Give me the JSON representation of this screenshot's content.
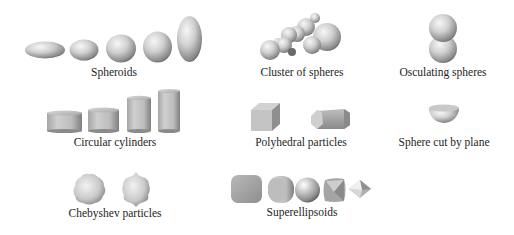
{
  "figure": {
    "background": "#ffffff",
    "shape_color_light": "#f4f4f4",
    "shape_color_mid": "#bdbdbd",
    "shape_color_dark": "#6e6e6e",
    "panels": [
      {
        "id": "spheroids",
        "label": "Spheroids",
        "count": 5
      },
      {
        "id": "cluster",
        "label": "Cluster of spheres",
        "count": 1
      },
      {
        "id": "osculating",
        "label": "Osculating spheres",
        "count": 1
      },
      {
        "id": "cylinders",
        "label": "Circular cylinders",
        "count": 4
      },
      {
        "id": "polyhedral",
        "label": "Polyhedral particles",
        "count": 2
      },
      {
        "id": "sphere-cut",
        "label": "Sphere cut by plane",
        "count": 1
      },
      {
        "id": "chebyshev",
        "label": "Chebyshev particles",
        "count": 2
      },
      {
        "id": "superellipsoids",
        "label": "Superellipsoids",
        "count": 5
      }
    ]
  }
}
